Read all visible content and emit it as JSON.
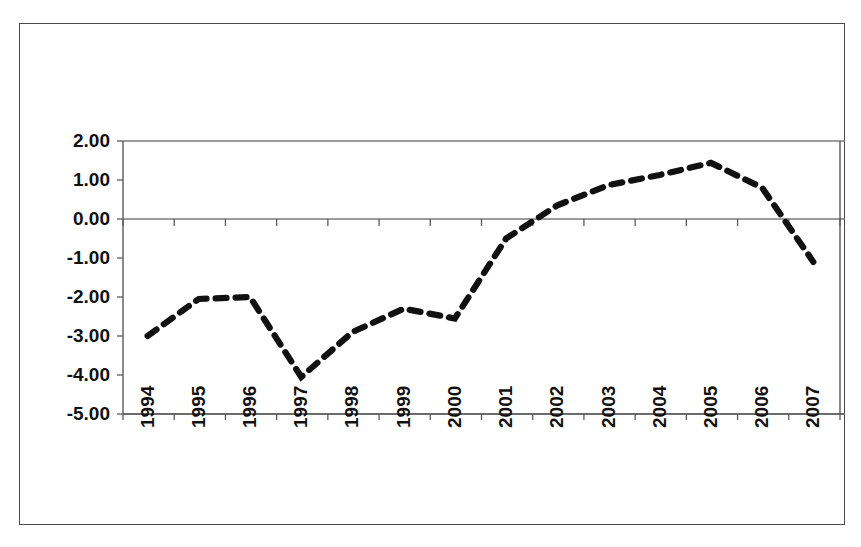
{
  "chart_data": {
    "type": "line",
    "title": "",
    "subtitle": "",
    "xlabel": "",
    "ylabel": "",
    "categories": [
      "1994",
      "1995",
      "1996",
      "1997",
      "1998",
      "1999",
      "2000",
      "2001",
      "2002",
      "2003",
      "2004",
      "2005",
      "2006",
      "2007"
    ],
    "series": [
      {
        "name": "series-1",
        "style": "dashed",
        "color": "#111111",
        "values": [
          -3.0,
          -2.05,
          -2.0,
          -4.05,
          -2.9,
          -2.3,
          -2.55,
          -0.5,
          0.35,
          0.87,
          1.13,
          1.44,
          0.8,
          -1.1
        ]
      }
    ],
    "ylim": [
      -5.0,
      2.0
    ],
    "yticks": [
      2.0,
      1.0,
      0.0,
      -1.0,
      -2.0,
      -3.0,
      -4.0,
      -5.0
    ],
    "ytick_labels": [
      "2.00",
      "1.00",
      "0.00",
      "-1.00",
      "-2.00",
      "-3.00",
      "-4.00",
      "-5.00"
    ],
    "xtick_labels": [
      "1994",
      "1995",
      "1996",
      "1997",
      "1998",
      "1999",
      "2000",
      "2001",
      "2002",
      "2003",
      "2004",
      "2005",
      "2006",
      "2007"
    ],
    "grid": "horizontal-at-zero-and-top",
    "gridlines_at": [
      2.0,
      0.0,
      -5.0
    ],
    "legend": [],
    "legend_position": "none",
    "annotations": [],
    "axis_color": "#5b5b5b",
    "background_color": "#ffffff"
  },
  "figure": {
    "frame_border_color": "#4a4a4a",
    "xtick_label_rotation": "-90"
  }
}
